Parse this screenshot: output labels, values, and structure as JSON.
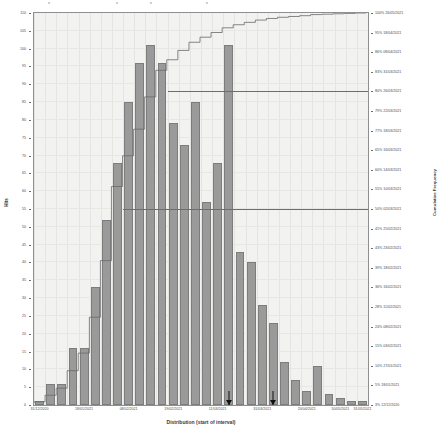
{
  "chart_data": {
    "type": "bar",
    "title": "",
    "xlabel": "Distribution (start of interval)",
    "ylabel": "Hits",
    "y2label": "Cumulative Frequency",
    "ylim": [
      0,
      110
    ],
    "y2lim": [
      0,
      100
    ],
    "grid": true,
    "legend": "none",
    "categories": [
      "31/12/2020",
      "07/01/2021",
      "14/01/2021",
      "21/01/2021",
      "28/01/2021",
      "04/02/2021",
      "11/02/2021",
      "18/02/2021",
      "25/02/2021",
      "04/03/2021",
      "11/03/2021",
      "18/03/2021",
      "25/03/2021",
      "01/04/2021",
      "08/04/2021",
      "15/04/2021",
      "22/04/2021",
      "29/04/2021",
      "06/05/2021",
      "13/05/2021",
      "20/05/2021",
      "27/05/2021",
      "03/06/2021",
      "10/06/2021",
      "17/06/2021",
      "24/06/2021",
      "01/07/2021",
      "08/07/2021",
      "15/07/2021",
      "22/07/2021"
    ],
    "values": [
      1,
      6,
      6,
      16,
      16,
      33,
      52,
      68,
      85,
      96,
      101,
      96,
      79,
      73,
      85,
      57,
      68,
      101,
      43,
      40,
      28,
      23,
      12,
      7,
      4,
      11,
      3,
      2,
      1,
      1
    ],
    "cumulative_percent": [
      0.3,
      2.0,
      3.8,
      8.3,
      12.8,
      22.0,
      36.5,
      55.5,
      63.4,
      70.2,
      78.5,
      85.3,
      88.0,
      90.4,
      92.5,
      93.8,
      95.0,
      96.2,
      97.0,
      97.6,
      98.2,
      98.6,
      98.9,
      99.1,
      99.3,
      99.6,
      99.7,
      99.8,
      99.9,
      100.0
    ],
    "y_ticks": [
      "110",
      "105",
      "100",
      "95",
      "90",
      "85",
      "80",
      "75",
      "70",
      "65",
      "60",
      "55",
      "50",
      "45",
      "40",
      "35",
      "30",
      "25",
      "20",
      "15",
      "10",
      "5",
      "0"
    ],
    "y2_ticks": [
      {
        "percent": "100%",
        "date": "26/05/2021"
      },
      {
        "percent": "95%",
        "date": "18/04/2021"
      },
      {
        "percent": "86%",
        "date": "08/04/2021"
      },
      {
        "percent": "83%",
        "date": "31/03/2021"
      },
      {
        "percent": "80%",
        "date": "26/03/2021"
      },
      {
        "percent": "79%",
        "date": "22/03/2021"
      },
      {
        "percent": "77%",
        "date": "18/03/2021"
      },
      {
        "percent": "65%",
        "date": "16/03/2021"
      },
      {
        "percent": "60%",
        "date": "14/03/2021"
      },
      {
        "percent": "55%",
        "date": "10/03/2021"
      },
      {
        "percent": "50%",
        "date": "02/03/2021"
      },
      {
        "percent": "41%",
        "date": "25/02/2021"
      },
      {
        "percent": "43%",
        "date": "23/02/2021"
      },
      {
        "percent": "39%",
        "date": "18/02/2021"
      },
      {
        "percent": "36%",
        "date": "16/02/2021"
      },
      {
        "percent": "28%",
        "date": "11/02/2021"
      },
      {
        "percent": "24%",
        "date": "08/02/2021"
      },
      {
        "percent": "15%",
        "date": "03/02/2021"
      },
      {
        "percent": "10%",
        "date": "27/01/2021"
      },
      {
        "percent": "5%",
        "date": "18/01/2021"
      },
      {
        "percent": "3%",
        "date": "12/12/2020"
      }
    ],
    "x_tick_labels": [
      {
        "label": "31/12/2020",
        "index": 0
      },
      {
        "label": "18/01/2021",
        "index": 4
      },
      {
        "label": "08/02/2021",
        "index": 8
      },
      {
        "label": "19/02/2021",
        "index": 12
      },
      {
        "label": "11/03/2021",
        "index": 16
      },
      {
        "label": "31/03/2021",
        "index": 20
      },
      {
        "label": "20/04/2021",
        "index": 24
      },
      {
        "label": "10/05/2021",
        "index": 27
      },
      {
        "label": "31/05/2021",
        "index": 29
      }
    ],
    "reference_lines": [
      {
        "name": "upper-reference",
        "percent": 80
      },
      {
        "name": "lower-reference",
        "percent": 50
      }
    ],
    "markers": [
      {
        "name": "marker-left",
        "index": 17
      },
      {
        "name": "marker-right",
        "index": 21
      }
    ],
    "colors": {
      "bar_fill": "#9a9a9a",
      "bar_stroke": "#7d7d7d",
      "ogive_line": "#6a6a6a",
      "plot_background": "#f2f2f0",
      "grid": "#e4e4e1",
      "axis": "#8f8f8f",
      "reference_line": "#6d6d6d",
      "marker": "#111111",
      "text": "#4a4a4a"
    }
  }
}
